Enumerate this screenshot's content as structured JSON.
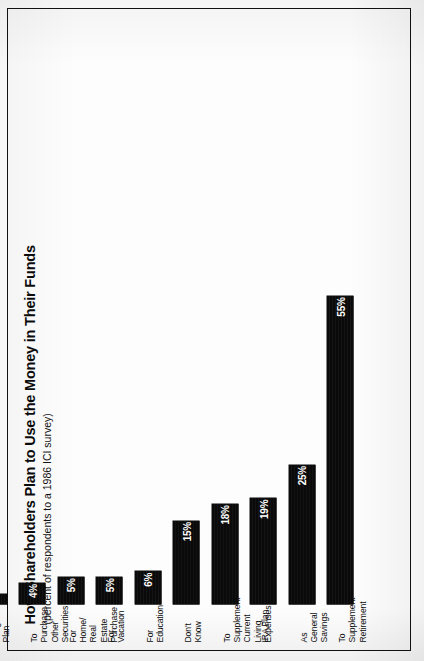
{
  "chart_data": {
    "type": "bar",
    "orientation": "horizontal",
    "title": "How Shareholders Plan to Use the Money in Their Funds",
    "subtitle": "(percent of respondents to a 1986 ICI survey)",
    "xlabel": "",
    "ylabel": "",
    "unit": "%",
    "grid": false,
    "legend": false,
    "axis_visible": false,
    "xlim": [
      0,
      55
    ],
    "categories": [
      "To\nSupplement\nRetirement",
      "As General\nSavings",
      "IRA Plan",
      "To\nSupplement\nCurrent\nLiving Expenses",
      "Don't\nKnow",
      "For\nEducation",
      "For\nVacation",
      "For\nHome/\nReal Estate\nPurchase",
      "To\nPurchase\nOther\nSecurities",
      "Keogh\nPlan"
    ],
    "values": [
      55,
      25,
      19,
      18,
      15,
      6,
      5,
      5,
      4,
      2
    ],
    "data_labels": [
      "55%",
      "25%",
      "19%",
      "18%",
      "15%",
      "6%",
      "5%",
      "5%",
      "4%",
      "2%"
    ],
    "bar_color": "#0a0a0a",
    "label_color": "#ffffff",
    "background": "#ffffff"
  },
  "figure": {
    "frame_color": "#121212",
    "page_background": "#ffffff"
  }
}
